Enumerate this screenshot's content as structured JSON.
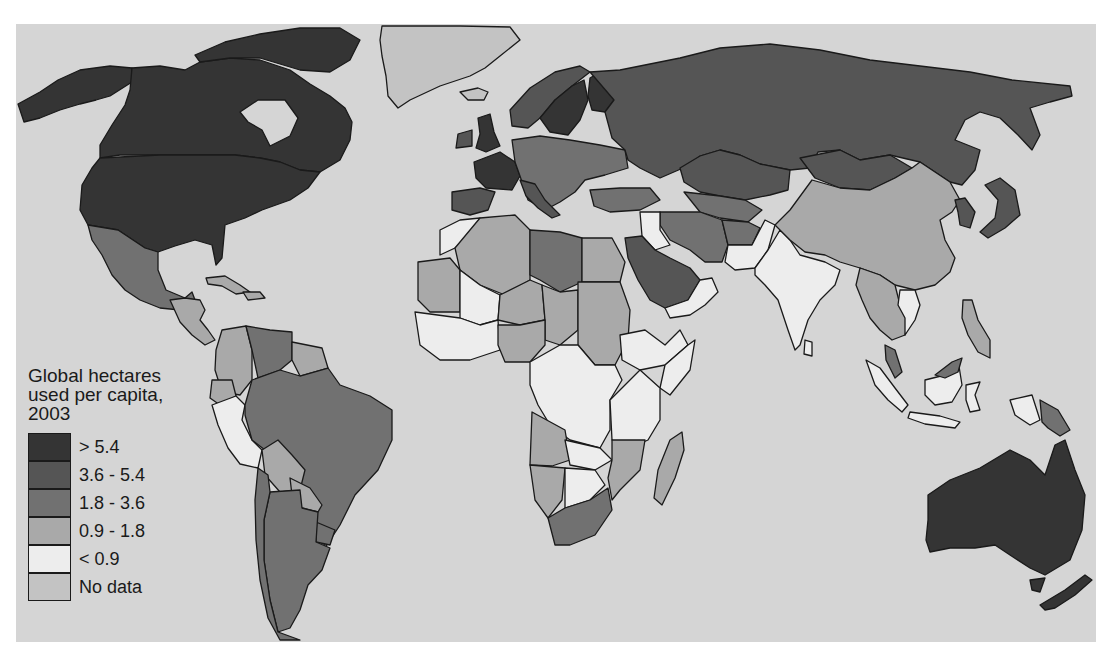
{
  "map": {
    "type": "choropleth",
    "subject": "Ecological footprint",
    "background_color": "#d5d5d5"
  },
  "legend": {
    "title": "Global hectares\nused per capita,\n2003",
    "items": [
      {
        "label": "> 5.4",
        "color": "#343434"
      },
      {
        "label": "3.6 - 5.4",
        "color": "#555555"
      },
      {
        "label": "1.8 - 3.6",
        "color": "#717171"
      },
      {
        "label": "0.9 - 1.8",
        "color": "#a9a9a9"
      },
      {
        "label": "< 0.9",
        "color": "#ededed"
      },
      {
        "label": "No data",
        "color": "#c3c3c3"
      }
    ]
  },
  "regions": [
    {
      "name": "Canada",
      "class": "> 5.4"
    },
    {
      "name": "United States",
      "class": "> 5.4"
    },
    {
      "name": "Alaska",
      "class": "> 5.4"
    },
    {
      "name": "Greenland",
      "class": "No data"
    },
    {
      "name": "Mexico",
      "class": "1.8 - 3.6"
    },
    {
      "name": "Central America",
      "class": "0.9 - 1.8"
    },
    {
      "name": "Caribbean",
      "class": "0.9 - 1.8"
    },
    {
      "name": "Brazil",
      "class": "1.8 - 3.6"
    },
    {
      "name": "Argentina",
      "class": "1.8 - 3.6"
    },
    {
      "name": "Chile",
      "class": "1.8 - 3.6"
    },
    {
      "name": "Peru",
      "class": "< 0.9"
    },
    {
      "name": "Colombia",
      "class": "0.9 - 1.8"
    },
    {
      "name": "Venezuela",
      "class": "1.8 - 3.6"
    },
    {
      "name": "Bolivia",
      "class": "0.9 - 1.8"
    },
    {
      "name": "Paraguay",
      "class": "0.9 - 1.8"
    },
    {
      "name": "Uruguay",
      "class": "1.8 - 3.6"
    },
    {
      "name": "Ecuador",
      "class": "0.9 - 1.8"
    },
    {
      "name": "Guianas",
      "class": "0.9 - 1.8"
    },
    {
      "name": "Russia",
      "class": "3.6 - 5.4"
    },
    {
      "name": "Kazakhstan",
      "class": "3.6 - 5.4"
    },
    {
      "name": "Mongolia",
      "class": "3.6 - 5.4"
    },
    {
      "name": "China",
      "class": "0.9 - 1.8"
    },
    {
      "name": "India",
      "class": "< 0.9"
    },
    {
      "name": "Pakistan",
      "class": "< 0.9"
    },
    {
      "name": "Iran",
      "class": "1.8 - 3.6"
    },
    {
      "name": "Afghanistan",
      "class": "1.8 - 3.6"
    },
    {
      "name": "Saudi Arabia",
      "class": "3.6 - 5.4"
    },
    {
      "name": "Yemen",
      "class": "< 0.9"
    },
    {
      "name": "Oman",
      "class": "< 0.9"
    },
    {
      "name": "Iraq",
      "class": "< 0.9"
    },
    {
      "name": "Turkey",
      "class": "1.8 - 3.6"
    },
    {
      "name": "Japan",
      "class": "3.6 - 5.4"
    },
    {
      "name": "Korea",
      "class": "3.6 - 5.4"
    },
    {
      "name": "Southeast Asia mainland",
      "class": "0.9 - 1.8"
    },
    {
      "name": "Indonesia",
      "class": "< 0.9"
    },
    {
      "name": "Malaysia",
      "class": "1.8 - 3.6"
    },
    {
      "name": "Papua New Guinea",
      "class": "1.8 - 3.6"
    },
    {
      "name": "Philippines",
      "class": "0.9 - 1.8"
    },
    {
      "name": "Australia",
      "class": "> 5.4"
    },
    {
      "name": "New Zealand",
      "class": "> 5.4"
    },
    {
      "name": "United Kingdom",
      "class": "> 5.4"
    },
    {
      "name": "France",
      "class": "> 5.4"
    },
    {
      "name": "Sweden/Finland",
      "class": "> 5.4"
    },
    {
      "name": "Norway",
      "class": "3.6 - 5.4"
    },
    {
      "name": "Spain/Portugal",
      "class": "3.6 - 5.4"
    },
    {
      "name": "Central/Eastern Europe",
      "class": "1.8 - 3.6"
    },
    {
      "name": "Iceland",
      "class": "No data"
    },
    {
      "name": "Algeria",
      "class": "0.9 - 1.8"
    },
    {
      "name": "Libya",
      "class": "1.8 - 3.6"
    },
    {
      "name": "Egypt",
      "class": "0.9 - 1.8"
    },
    {
      "name": "Sudan",
      "class": "0.9 - 1.8"
    },
    {
      "name": "Mali",
      "class": "< 0.9"
    },
    {
      "name": "Mauritania",
      "class": "0.9 - 1.8"
    },
    {
      "name": "Niger",
      "class": "0.9 - 1.8"
    },
    {
      "name": "Chad",
      "class": "0.9 - 1.8"
    },
    {
      "name": "Nigeria",
      "class": "0.9 - 1.8"
    },
    {
      "name": "Ethiopia",
      "class": "< 0.9"
    },
    {
      "name": "Somalia",
      "class": "< 0.9"
    },
    {
      "name": "DR Congo",
      "class": "< 0.9"
    },
    {
      "name": "Kenya/Tanzania",
      "class": "< 0.9"
    },
    {
      "name": "Angola",
      "class": "0.9 - 1.8"
    },
    {
      "name": "Namibia",
      "class": "0.9 - 1.8"
    },
    {
      "name": "Botswana/Zambia",
      "class": "< 0.9"
    },
    {
      "name": "Mozambique",
      "class": "0.9 - 1.8"
    },
    {
      "name": "South Africa",
      "class": "1.8 - 3.6"
    },
    {
      "name": "Madagascar",
      "class": "0.9 - 1.8"
    },
    {
      "name": "Morocco",
      "class": "< 0.9"
    }
  ]
}
